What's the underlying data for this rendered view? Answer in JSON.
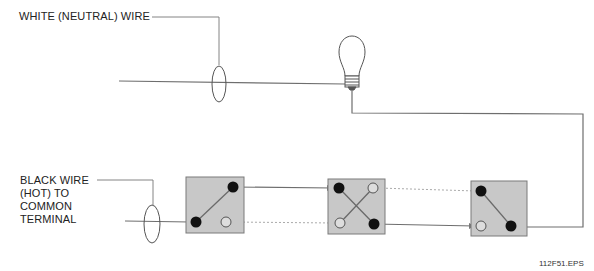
{
  "labels": {
    "white_wire": "WHITE (NEUTRAL) WIRE",
    "black_wire_lines": [
      "BLACK WIRE",
      "(HOT) TO",
      "COMMON",
      "TERMINAL"
    ]
  },
  "figure_id": "112F51.EPS",
  "colors": {
    "wire": "#6e6e6e",
    "switch_box_fill": "#c8c8c8",
    "switch_box_stroke": "#7a7a7a",
    "terminal_filled": "#111111",
    "terminal_open_stroke": "#555555",
    "traveler_dashed": "#aaaaaa"
  },
  "components": {
    "lamp": "light-bulb",
    "switches": [
      {
        "name": "three-way-switch-1",
        "type": "3-way"
      },
      {
        "name": "four-way-switch",
        "type": "4-way"
      },
      {
        "name": "three-way-switch-2",
        "type": "3-way"
      }
    ]
  }
}
